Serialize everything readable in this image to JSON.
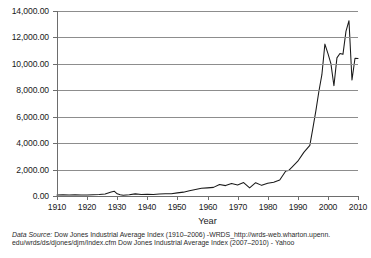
{
  "chart_data": {
    "type": "line",
    "title": "",
    "xlabel": "Year",
    "ylabel": "",
    "grid": true,
    "legend_position": "none",
    "xlim": [
      1910,
      2010
    ],
    "ylim": [
      0,
      14000
    ],
    "y_tick_labels": [
      "14,000.00",
      "12,000.00",
      "10,000.00",
      "8,000.00",
      "6,000.00",
      "4,000.00",
      "2,000.00",
      "0.00"
    ],
    "y_tick_values": [
      14000,
      12000,
      10000,
      8000,
      6000,
      4000,
      2000,
      0
    ],
    "x_tick_labels": [
      "1910",
      "1920",
      "1930",
      "1940",
      "1950",
      "1960",
      "1970",
      "1980",
      "1990",
      "2000",
      "2010"
    ],
    "x_tick_values": [
      1910,
      1920,
      1930,
      1940,
      1950,
      1960,
      1970,
      1980,
      1990,
      2000,
      2010
    ],
    "series": [
      {
        "name": "Dow Jones Industrial Average Index",
        "color": "#1a1a1a",
        "x": [
          1910,
          1912,
          1914,
          1916,
          1918,
          1920,
          1922,
          1924,
          1926,
          1928,
          1929,
          1930,
          1931,
          1932,
          1934,
          1936,
          1938,
          1940,
          1942,
          1944,
          1946,
          1948,
          1950,
          1952,
          1954,
          1956,
          1958,
          1960,
          1962,
          1964,
          1966,
          1968,
          1970,
          1972,
          1974,
          1976,
          1978,
          1980,
          1982,
          1984,
          1986,
          1987,
          1988,
          1990,
          1992,
          1994,
          1995,
          1996,
          1997,
          1998,
          1999,
          2000,
          2001,
          2002,
          2003,
          2004,
          2005,
          2006,
          2007,
          2008,
          2009,
          2010
        ],
        "y": [
          82,
          88,
          76,
          95,
          82,
          72,
          92,
          110,
          157,
          300,
          365,
          165,
          95,
          60,
          100,
          160,
          120,
          131,
          110,
          148,
          177,
          177,
          235,
          292,
          404,
          499,
          584,
          616,
          652,
          874,
          786,
          944,
          839,
          1020,
          616,
          1005,
          805,
          964,
          1047,
          1212,
          1896,
          1939,
          2169,
          2634,
          3301,
          3834,
          5117,
          6448,
          7908,
          9181,
          11497,
          10788,
          10022,
          8342,
          10454,
          10783,
          10718,
          12463,
          13265,
          8776,
          10428,
          10400
        ],
        "peak_2007": 13300,
        "trough_2009": 7500,
        "peak_1999": 11500,
        "trough_2002": 8000
      }
    ]
  },
  "caption": {
    "label": "Data Source:",
    "line1": " Dow Jones Industrial Average Index (1910–2006) -WRDS_http://wrds-web.wharton.upenn.",
    "line2": "edu/wrds/ds/djones/djm/Index.cfm Dow Jones Industrial Average Index (2007–2010) - Yahoo"
  }
}
